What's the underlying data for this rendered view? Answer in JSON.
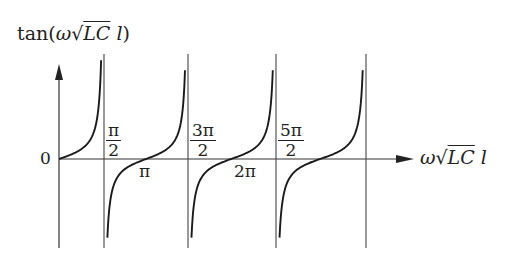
{
  "diagram": {
    "y_axis_label": {
      "prefix": "tan",
      "open": "(",
      "omega": "ω",
      "sqrt": "√",
      "LC": "LC",
      "l": "l",
      "close": ")"
    },
    "x_axis_label": {
      "omega": "ω",
      "sqrt": "√",
      "LC": "LC",
      "l": "l"
    },
    "origin_label": "0",
    "fraction_labels": [
      {
        "num": "π",
        "den": "2"
      },
      {
        "num": "3π",
        "den": "2"
      },
      {
        "num": "5π",
        "den": "2"
      }
    ],
    "zero_crossing_labels": [
      "π",
      "2π"
    ],
    "asymptotes": [
      "π/2",
      "3π/2",
      "5π/2",
      "7π/2"
    ],
    "colors": {
      "line": "#222222",
      "curve": "#1a1a1a",
      "background": "#ffffff"
    }
  }
}
